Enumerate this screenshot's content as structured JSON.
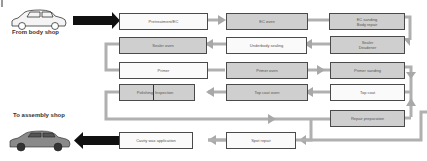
{
  "labels": {
    "from_body_shop": "From body shop",
    "to_assembly_shop": "To assembly shop"
  },
  "process_steps": [
    {
      "id": "pretreatment",
      "label": "Pretreatment/EC",
      "style": "white"
    },
    {
      "id": "ec-oven",
      "label": "EC oven",
      "style": "gray"
    },
    {
      "id": "ec-sanding",
      "label": "EC sanding\nBody repair",
      "style": "gray"
    },
    {
      "id": "sealer-deadener",
      "label": "Sealer\nDeadener",
      "style": "gray"
    },
    {
      "id": "underbody-sealing",
      "label": "Underbody sealing",
      "style": "white"
    },
    {
      "id": "sealer-oven",
      "label": "Sealer oven",
      "style": "gray"
    },
    {
      "id": "primer",
      "label": "Primer",
      "style": "white"
    },
    {
      "id": "primer-oven",
      "label": "Primer oven",
      "style": "gray"
    },
    {
      "id": "primer-sanding",
      "label": "Primer sanding",
      "style": "gray"
    },
    {
      "id": "top-coat",
      "label": "Top coat",
      "style": "white"
    },
    {
      "id": "top-coat-oven",
      "label": "Top coat oven",
      "style": "gray"
    },
    {
      "id": "polishing-inspection",
      "label_left": "Polishing",
      "label_right": "Inspection",
      "style": "gray"
    },
    {
      "id": "repair-preparation",
      "label": "Repair preparation",
      "style": "gray"
    },
    {
      "id": "spot-repair",
      "label": "Spot repair",
      "style": "white"
    },
    {
      "id": "cavity-wax",
      "label": "Cavity wax application",
      "style": "white"
    }
  ],
  "colors": {
    "box_gray": "#cfcfcf",
    "box_white": "#fafafa",
    "flow_arrow": "#a8a8a8",
    "main_arrow": "#111111"
  }
}
